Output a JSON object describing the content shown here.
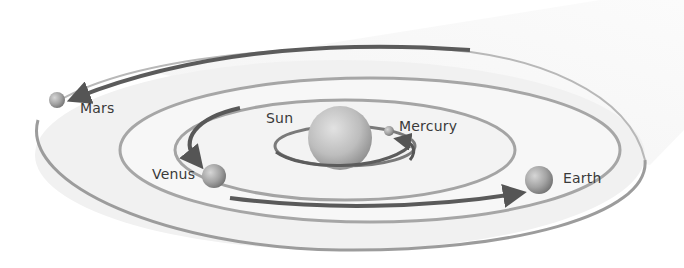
{
  "diagram": {
    "type": "solar-system-orbits",
    "colors": {
      "background": "#ffffff",
      "disk": "#eeeeee",
      "orbit_line": "#a8a8a8",
      "arrow": "#5a5a5a",
      "sun": "#b9b9b9",
      "planet": "#9a9a9a",
      "text": "#3a3a3a"
    },
    "bodies": {
      "sun": {
        "label": "Sun"
      },
      "mercury": {
        "label": "Mercury"
      },
      "venus": {
        "label": "Venus"
      },
      "earth": {
        "label": "Earth"
      },
      "mars": {
        "label": "Mars"
      }
    }
  }
}
